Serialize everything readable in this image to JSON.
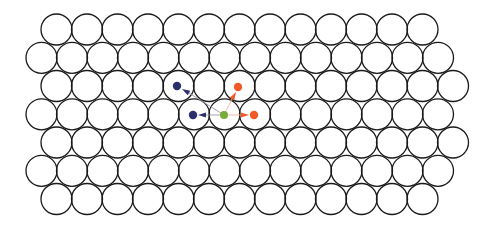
{
  "diagram": {
    "type": "close-packed-lattice",
    "width": 490,
    "height": 229,
    "background": "#ffffff",
    "atom_radius": 15.5,
    "atom_stroke": "#1a1a1a",
    "atom_stroke_width": 1.3,
    "x_spacing": 30.5,
    "rows": [
      {
        "y": 29.5,
        "x_start": 56.5,
        "count": 13
      },
      {
        "y": 57.8,
        "x_start": 41.5,
        "count": 14
      },
      {
        "y": 86.0,
        "x_start": 56.5,
        "count": 14
      },
      {
        "y": 114.3,
        "x_start": 41.5,
        "count": 14
      },
      {
        "y": 142.5,
        "x_start": 56.5,
        "count": 14
      },
      {
        "y": 170.8,
        "x_start": 41.5,
        "count": 14
      },
      {
        "y": 199.0,
        "x_start": 56.5,
        "count": 13
      }
    ],
    "center_site": {
      "label": "origin",
      "x": 224,
      "y": 115,
      "r": 4,
      "color": "#7aab3a"
    },
    "neighbor_sites": [
      {
        "label": "neighbor-navy-upper",
        "x": 177,
        "y": 86,
        "r": 4.2,
        "color": "#2b2f6e",
        "arrow_tip": [
          182,
          89
        ],
        "arrow_base": [
          189,
          93
        ]
      },
      {
        "label": "neighbor-navy-left",
        "x": 193,
        "y": 115,
        "r": 4.2,
        "color": "#2b2f6e",
        "arrow_tip": [
          198,
          115
        ],
        "arrow_base": [
          206,
          115
        ]
      },
      {
        "label": "neighbor-orange-upper",
        "x": 238,
        "y": 87,
        "r": 4.2,
        "color": "#f05a28",
        "arrow_tip": [
          236,
          92
        ],
        "arrow_base": [
          232,
          99
        ]
      },
      {
        "label": "neighbor-orange-right",
        "x": 254,
        "y": 115,
        "r": 4.2,
        "color": "#f05a28",
        "arrow_tip": [
          249,
          115
        ],
        "arrow_base": [
          241,
          115
        ]
      }
    ],
    "connector_colors": {
      "navy": "#9a9aa6",
      "orange": "#f4b39a"
    }
  }
}
